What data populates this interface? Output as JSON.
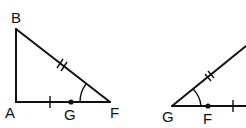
{
  "figure": {
    "left_triangle": {
      "vertices": {
        "B": "B",
        "A": "A",
        "F": "F"
      },
      "point_on_side": "G",
      "markings": {
        "BF": "double tick (congruent)",
        "AF": "single tick",
        "angle_F": "arc"
      }
    },
    "right_triangle": {
      "vertices": {
        "G": "G"
      },
      "point_on_side": "F",
      "markings": {
        "hypotenuse": "double tick (congruent)",
        "base": "single tick",
        "angle_G": "arc"
      }
    }
  }
}
